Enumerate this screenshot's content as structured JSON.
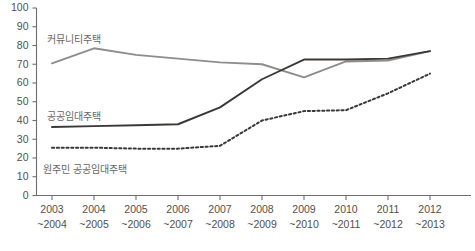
{
  "chart_data": {
    "type": "line",
    "title": "",
    "subtitle": "",
    "xlabel": "",
    "ylabel": "",
    "ylim": [
      0,
      100
    ],
    "ytick_step": 10,
    "grid": false,
    "legend_position": "inline-labels",
    "categories": [
      "2003\n~2004",
      "2004\n~2005",
      "2005\n~2006",
      "2006\n~2007",
      "2007\n~2008",
      "2008\n~2009",
      "2009\n~2010",
      "2010\n~2011",
      "2011\n~2012",
      "2012\n~2013"
    ],
    "x_tick_labels_line1": [
      "2003",
      "2004",
      "2005",
      "2006",
      "2007",
      "2008",
      "2009",
      "2010",
      "2011",
      "2012"
    ],
    "x_tick_labels_line2": [
      "~2004",
      "~2005",
      "~2006",
      "~2007",
      "~2008",
      "~2009",
      "~2010",
      "~2011",
      "~2012",
      "~2013"
    ],
    "y_tick_labels": [
      "0",
      "10",
      "20",
      "30",
      "40",
      "50",
      "60",
      "70",
      "80",
      "90",
      "100"
    ],
    "y_tick_values": [
      0,
      10,
      20,
      30,
      40,
      50,
      60,
      70,
      80,
      90,
      100
    ],
    "series": [
      {
        "name": "커뮤니티주택",
        "style": "solid",
        "color": "#8f8d8b",
        "width": 1.9,
        "x": [
          0,
          1,
          2,
          3,
          4,
          5,
          6,
          7,
          8,
          9
        ],
        "values": [
          70.5,
          78.5,
          75.0,
          73.0,
          71.0,
          70.0,
          63.0,
          71.5,
          72.0,
          77.0
        ]
      },
      {
        "name": "공공임대주택",
        "style": "solid",
        "color": "#3b3937",
        "width": 1.9,
        "x": [
          0,
          1,
          2,
          3,
          4,
          5,
          6,
          7,
          8,
          9
        ],
        "values": [
          36.5,
          37.0,
          37.5,
          38.0,
          47.0,
          62.0,
          72.5,
          72.5,
          73.0,
          77.0
        ]
      },
      {
        "name": "원주민 공공임대주택",
        "style": "dotted",
        "color": "#3b3937",
        "width": 2.0,
        "x": [
          0,
          1,
          2,
          3,
          4,
          5,
          6,
          7,
          8,
          9
        ],
        "values": [
          25.5,
          25.5,
          25.0,
          25.0,
          26.5,
          40.0,
          45.0,
          45.5,
          54.5,
          65.0
        ]
      }
    ],
    "annotations": [
      {
        "text": "커뮤니티주택",
        "x_px": 47,
        "y_px": 43,
        "anchor": "start"
      },
      {
        "text": "공공임대주택",
        "x_px": 47,
        "y_px": 120,
        "anchor": "start"
      },
      {
        "text": "원주민 공공임대주택",
        "x_px": 43,
        "y_px": 173,
        "anchor": "start"
      }
    ]
  },
  "axes": {
    "y_axis_name": "value-axis",
    "x_axis_name": "period-axis"
  },
  "footer": {
    "source_note": ""
  }
}
